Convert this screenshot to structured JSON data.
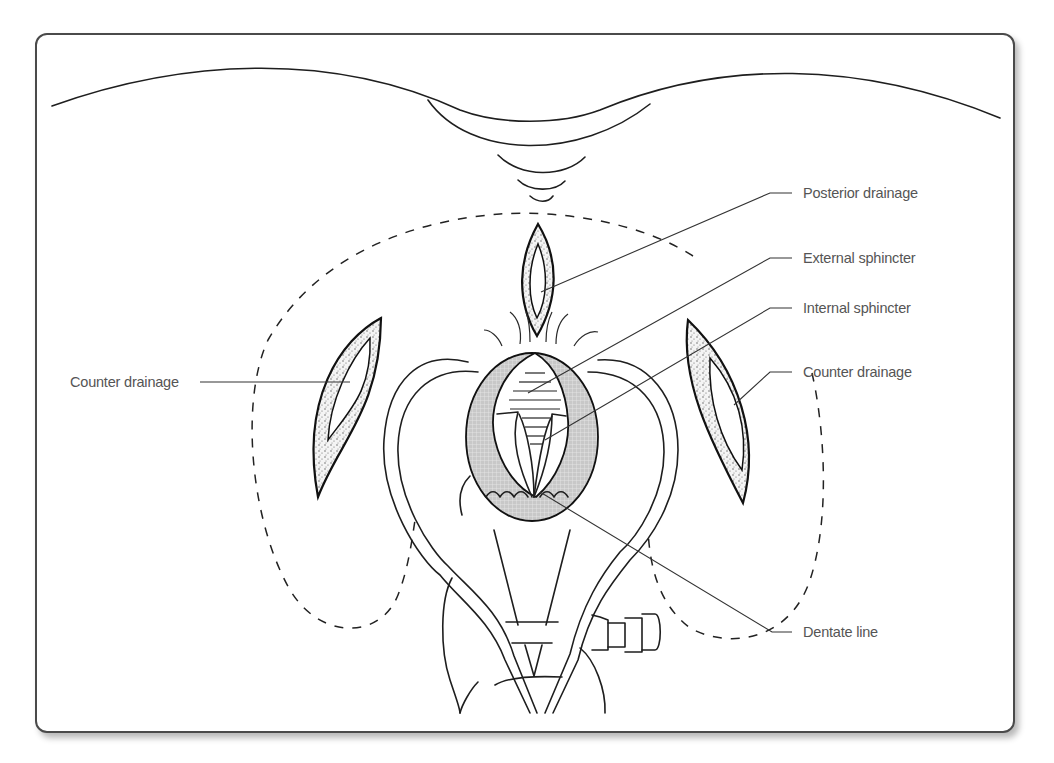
{
  "figure": {
    "labels": {
      "posterior_drainage": "Posterior drainage",
      "external_sphincter": "External sphincter",
      "internal_sphincter": "Internal sphincter",
      "counter_drainage_right": "Counter drainage",
      "counter_drainage_left": "Counter drainage",
      "dentate_line": "Dentate line"
    }
  }
}
